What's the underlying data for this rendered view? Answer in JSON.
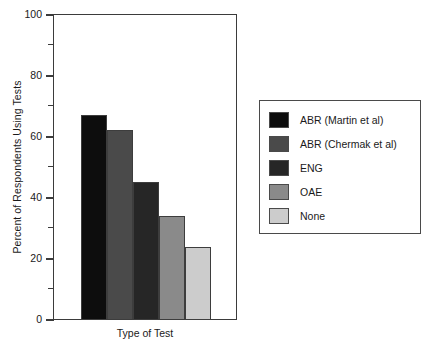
{
  "chart_data": {
    "type": "bar",
    "title": "",
    "xlabel": "Type of Test",
    "ylabel": "Percent of Respondents Using Tests",
    "categories": [
      "ABR (Martin et al)",
      "ABR (Chermak et al)",
      "ENG",
      "OAE",
      "None"
    ],
    "values": [
      67,
      62,
      45,
      34,
      24
    ],
    "series": [
      {
        "name": "Percent of Respondents Using Tests",
        "values": [
          67,
          62,
          45,
          34,
          24
        ]
      }
    ],
    "colors": [
      "#0d0d0d",
      "#4a4a4a",
      "#262626",
      "#8a8a8a",
      "#cccccc"
    ],
    "ylim": [
      0,
      100
    ],
    "yticks": [
      0,
      20,
      40,
      60,
      80,
      100
    ],
    "ytick_labels": [
      "0",
      "20",
      "40",
      "60",
      "80",
      "100"
    ],
    "yminor_ticks": [
      10,
      30,
      50,
      70,
      90
    ],
    "xticks": [],
    "grid": false,
    "legend_position": "right"
  },
  "legend": {
    "items": [
      {
        "label": "ABR (Martin et al)",
        "color": "#0d0d0d"
      },
      {
        "label": "ABR (Chermak et al)",
        "color": "#4a4a4a"
      },
      {
        "label": "ENG",
        "color": "#262626"
      },
      {
        "label": "OAE",
        "color": "#8a8a8a"
      },
      {
        "label": "None",
        "color": "#cccccc"
      }
    ]
  },
  "axis": {
    "y_title": "Percent of Respondents Using Tests",
    "x_title": "Type of Test",
    "tick_labels": [
      "100",
      "80",
      "60",
      "40",
      "20",
      "0"
    ]
  }
}
